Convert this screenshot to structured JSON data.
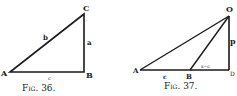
{
  "figures": [
    {
      "id": "fig36",
      "caption": "Fig. 36.",
      "vertices": {
        "A": {
          "label": "A",
          "x": 10,
          "y": 72
        },
        "B": {
          "label": "B",
          "x": 84,
          "y": 72
        },
        "C": {
          "label": "C",
          "x": 84,
          "y": 14
        }
      },
      "side_labels": {
        "a": "a",
        "b": "b",
        "c": "c"
      }
    },
    {
      "id": "fig37",
      "caption": "Fig. 37.",
      "vertices": {
        "A": {
          "label": "A",
          "x": 140,
          "y": 70
        },
        "B": {
          "label": "B",
          "x": 190,
          "y": 70
        },
        "D": {
          "label": "D",
          "x": 229,
          "y": 70
        },
        "O": {
          "label": "O",
          "x": 229,
          "y": 16
        }
      },
      "side_labels": {
        "c": "c",
        "x_minus_c": "x−c",
        "p": "p"
      }
    }
  ],
  "colors": {
    "ink": "#1a1a1a",
    "paper": "#ffffff"
  }
}
